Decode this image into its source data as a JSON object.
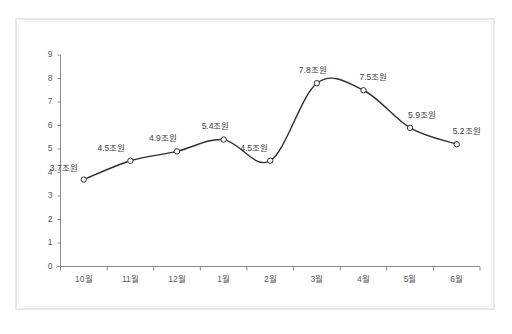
{
  "chart_data": {
    "type": "line",
    "title": "",
    "subtitle": "",
    "xlabel": "",
    "ylabel": "",
    "categories": [
      "10월",
      "11월",
      "12월",
      "1월",
      "2월",
      "3월",
      "4월",
      "5월",
      "6월"
    ],
    "values": [
      3.7,
      4.5,
      4.9,
      5.4,
      4.5,
      7.8,
      7.5,
      5.9,
      5.2
    ],
    "point_labels": [
      "3.7조원",
      "4.5조원",
      "4.9조원",
      "5.4조원",
      "4.5조원",
      "7.8조원",
      "7.5조원",
      "5.9조원",
      "5.2조원"
    ],
    "unit_suffix": "조원",
    "ylim": [
      0,
      9
    ],
    "ytick_labels": [
      "9",
      "8",
      "7",
      "6",
      "5",
      "4",
      "3",
      "2",
      "1",
      "0"
    ],
    "ytick_values": [
      9,
      8,
      7,
      6,
      5,
      4,
      3,
      2,
      1,
      0
    ],
    "grid": false,
    "legend": null,
    "legend_position": "none",
    "series": [
      {
        "name": "",
        "values": [
          3.7,
          4.5,
          4.9,
          5.4,
          4.5,
          7.8,
          7.5,
          5.9,
          5.2
        ],
        "line_color": "#2f2f33",
        "marker": "open-circle",
        "smoothed": true
      }
    ],
    "colors": {
      "line": "#2f2f33",
      "marker_stroke": "#2f2f33",
      "marker_fill": "#ffffff",
      "axis": "#8c8c90",
      "tick_text": "#59595c",
      "label_text": "#404044",
      "frame": "#e8e8e8",
      "background": "#ffffff"
    }
  },
  "axes": {
    "y_axis_name": "value-axis",
    "x_axis_name": "category-axis"
  }
}
